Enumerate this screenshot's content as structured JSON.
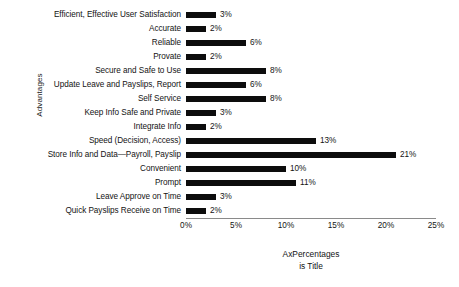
{
  "chart_data": {
    "type": "bar",
    "orientation": "horizontal",
    "title": "",
    "xlabel_lines": [
      "AxPercentages",
      "is Title"
    ],
    "ylabel": "Advantages",
    "xlim": [
      0,
      25
    ],
    "xtick_labels": [
      "0%",
      "5%",
      "10%",
      "15%",
      "20%",
      "25%"
    ],
    "xticks": [
      0,
      5,
      10,
      15,
      20,
      25
    ],
    "grid": false,
    "legend": false,
    "bar_color": "#0d0d0d",
    "axis_color": "#8a8a8a",
    "value_suffix": "%",
    "categories": [
      "Efficient, Effective User Satisfaction",
      "Accurate",
      "Reliable",
      "Provate",
      "Secure and Safe to Use",
      "Update Leave and Payslips, Report",
      "Self Service",
      "Keep Info Safe and Private",
      "Integrate Info",
      "Speed (Decision, Access)",
      "Store Info and Data—Payroll, Payslip",
      "Convenient",
      "Prompt",
      "Leave Approve on Time",
      "Quick Payslips Receive on Time"
    ],
    "values": [
      3,
      2,
      6,
      2,
      8,
      6,
      8,
      3,
      2,
      13,
      21,
      10,
      11,
      3,
      2
    ],
    "value_labels": [
      "3%",
      "2%",
      "6%",
      "2%",
      "8%",
      "6%",
      "8%",
      "3%",
      "2%",
      "13%",
      "21%",
      "10%",
      "11%",
      "3%",
      "2%"
    ]
  }
}
